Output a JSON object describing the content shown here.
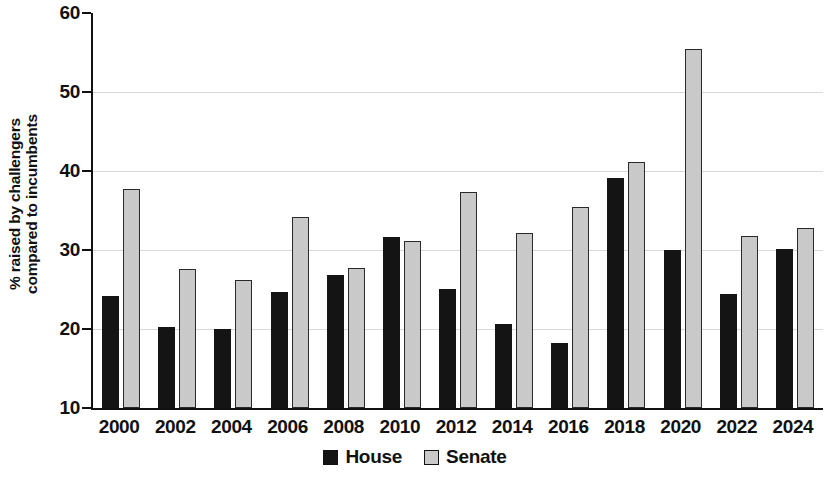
{
  "chart_data": {
    "type": "bar",
    "title": "",
    "subtitle": "",
    "xlabel": "",
    "ylabel": "% raised by challengers compared to incumbents",
    "ylabel_lines": [
      "% raised by challengers",
      "compared to incumbents"
    ],
    "categories": [
      "2000",
      "2002",
      "2004",
      "2006",
      "2008",
      "2010",
      "2012",
      "2014",
      "2016",
      "2018",
      "2020",
      "2022",
      "2024"
    ],
    "series": [
      {
        "name": "House",
        "color": "#141414",
        "values": [
          24.2,
          20.3,
          20.0,
          24.7,
          26.9,
          31.7,
          25.1,
          20.6,
          18.2,
          39.1,
          30.0,
          24.4,
          30.1
        ]
      },
      {
        "name": "Senate",
        "color": "#c9c9c9",
        "values": [
          37.7,
          27.6,
          26.2,
          34.2,
          27.7,
          31.1,
          37.4,
          32.2,
          35.5,
          41.1,
          55.5,
          31.8,
          32.8
        ]
      }
    ],
    "ylim": [
      10,
      60
    ],
    "yticks": [
      10,
      20,
      30,
      40,
      50,
      60
    ],
    "ytick_labels": [
      "10",
      "20",
      "30",
      "40",
      "50",
      "60"
    ],
    "grid": true,
    "grid_axis": "y",
    "legend_position": "bottom-center",
    "legend": [
      "House",
      "Senate"
    ],
    "annotations": []
  }
}
